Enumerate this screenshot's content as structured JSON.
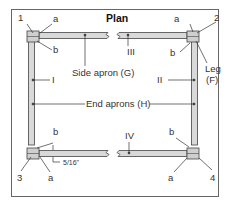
{
  "title": "Plan",
  "labels": {
    "corner_1": "1",
    "corner_2": "2",
    "corner_3": "3",
    "corner_4": "4",
    "a_tl": "a",
    "b_tl": "b",
    "a_tr": "a",
    "b_tr": "b",
    "a_bl": "a",
    "b_bl": "b",
    "a_br": "a",
    "b_br": "b",
    "apron_I": "I",
    "apron_II": "II",
    "apron_III": "III",
    "apron_IV": "IV",
    "side_apron": "Side apron (G)",
    "end_aprons": "End aprons (H)",
    "leg_line1": "Leg",
    "leg_line2": "(F)",
    "dimension": "5/16\""
  },
  "colors": {
    "frame": "#555555",
    "apron_fill": "#d9d9d9",
    "leg_fill": "#c8c8c8",
    "stroke": "#444444",
    "text": "#333333"
  }
}
